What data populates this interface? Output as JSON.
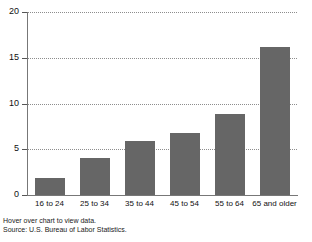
{
  "chart_data": {
    "type": "bar",
    "title": "",
    "subtitle": "",
    "xlabel": "",
    "ylabel": "",
    "categories": [
      "16 to 24",
      "25 to 34",
      "35 to 44",
      "45 to 54",
      "55 to 64",
      "65 and older"
    ],
    "values": [
      1.9,
      4.1,
      5.9,
      6.8,
      8.8,
      16.2
    ],
    "ylim": [
      0,
      20
    ],
    "ytick_labels": [
      "20",
      "15",
      "10",
      "5",
      "0"
    ],
    "ytick_values": [
      20,
      15,
      10,
      5,
      0
    ],
    "grid": true,
    "grid_style": "dotted-horizontal",
    "legend": "none",
    "bar_color": "#666666",
    "axis_color": "#777777",
    "grid_color": "#8d8d8d"
  },
  "footer": {
    "hint": "Hover over chart to view data.",
    "source": "Source: U.S. Bureau of Labor Statistics."
  }
}
